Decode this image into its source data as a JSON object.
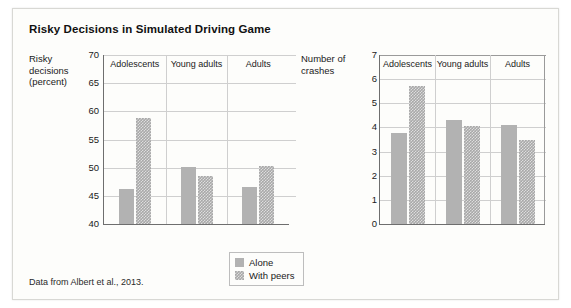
{
  "figure": {
    "title": "Risky Decisions in Simulated Driving Game",
    "source_note": "Data from Albert et al., 2013."
  },
  "legend": {
    "position": "bottom-center",
    "items": [
      {
        "label": "Alone",
        "swatch": "solid-gray"
      },
      {
        "label": "With peers",
        "swatch": "checkered-gray"
      }
    ]
  },
  "chart_data": [
    {
      "type": "bar",
      "title": "Risky Decisions in Simulated Driving Game",
      "panel": "left",
      "xlabel": "",
      "ylabel": "Risky decisions (percent)",
      "ylim": [
        40,
        70
      ],
      "yticks": [
        40,
        45,
        50,
        55,
        60,
        65,
        70
      ],
      "grid": true,
      "categories": [
        "Adolescents",
        "Young adults",
        "Adults"
      ],
      "series": [
        {
          "name": "Alone",
          "values": [
            46.3,
            50.1,
            46.5
          ]
        },
        {
          "name": "With peers",
          "values": [
            58.8,
            48.5,
            50.3
          ]
        }
      ]
    },
    {
      "type": "bar",
      "panel": "right",
      "xlabel": "",
      "ylabel": "Number of crashes",
      "ylim": [
        0,
        7
      ],
      "yticks": [
        0,
        1,
        2,
        3,
        4,
        5,
        6,
        7
      ],
      "grid": true,
      "categories": [
        "Adolescents",
        "Young adults",
        "Adults"
      ],
      "series": [
        {
          "name": "Alone",
          "values": [
            3.75,
            4.3,
            4.1
          ]
        },
        {
          "name": "With peers",
          "values": [
            5.7,
            4.05,
            3.5
          ]
        }
      ]
    }
  ]
}
